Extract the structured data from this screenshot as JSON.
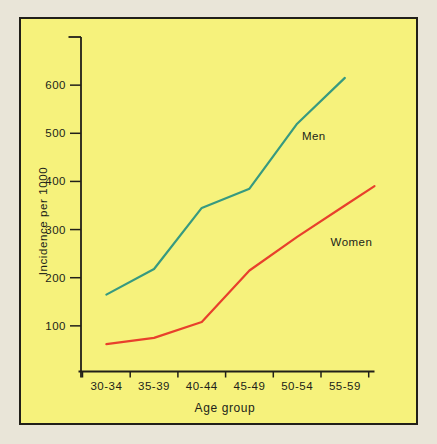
{
  "page": {
    "background_color": "#e9e5d8",
    "panel_color": "#f6f27c",
    "panel_border_color": "#211f19"
  },
  "chart_data": {
    "type": "line",
    "title": "",
    "xlabel": "Age group",
    "ylabel": "Incidence per 1000",
    "categories": [
      "30-34",
      "35-39",
      "40-44",
      "45-49",
      "50-54",
      "55-59"
    ],
    "yticks": [
      100,
      200,
      300,
      400,
      500,
      600
    ],
    "ylim": [
      0,
      700
    ],
    "grid": false,
    "legend_position": "inline-labels",
    "axis_color": "#211f19",
    "series": [
      {
        "name": "Men",
        "color": "#379a80",
        "values": [
          165,
          218,
          345,
          385,
          520,
          615
        ]
      },
      {
        "name": "Women",
        "color": "#e8402c",
        "values": [
          62,
          75,
          108,
          215,
          285,
          350
        ],
        "extends_to_value": 390
      }
    ],
    "annotations": [
      {
        "text": "Men",
        "x": 4.1,
        "y": 495
      },
      {
        "text": "Women",
        "x": 4.7,
        "y": 275
      }
    ]
  }
}
